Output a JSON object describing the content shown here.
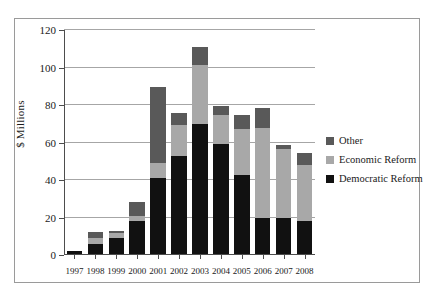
{
  "chart_data": {
    "type": "bar",
    "subtype": "stacked-vertical",
    "title": "",
    "xlabel": "",
    "ylabel": "$ Millions",
    "ylim": [
      0,
      120
    ],
    "yticks": [
      0,
      20,
      40,
      60,
      80,
      100,
      120
    ],
    "ytick_labels": [
      "0",
      "20",
      "40",
      "60",
      "80",
      "100",
      "120"
    ],
    "grid": true,
    "grid_axis": "y",
    "legend_position": "right",
    "categories": [
      "1997",
      "1998",
      "1999",
      "2000",
      "2001",
      "2002",
      "2003",
      "2004",
      "2005",
      "2006",
      "2007",
      "2008"
    ],
    "series": [
      {
        "name": "Democratic Reform",
        "color": "#111111",
        "values": [
          1.5,
          5.5,
          8.5,
          17.5,
          40.5,
          52.5,
          69.5,
          58.5,
          42,
          19,
          19,
          17.5
        ]
      },
      {
        "name": "Economic Reform",
        "color": "#a8a8a8",
        "values": [
          0,
          3,
          2.5,
          3,
          8,
          16.5,
          31.5,
          15.5,
          24.5,
          48,
          37,
          30
        ]
      },
      {
        "name": "Other",
        "color": "#595959",
        "values": [
          0,
          3,
          1.5,
          7,
          40.5,
          6,
          9.5,
          5,
          7.5,
          11,
          2,
          6.5
        ]
      }
    ],
    "totals": [
      1.5,
      11.5,
      12.5,
      27.5,
      89,
      75,
      110.5,
      79,
      74,
      78,
      58,
      54
    ]
  },
  "legend": {
    "items": [
      {
        "label": "Other",
        "color": "#595959"
      },
      {
        "label": "Economic Reform",
        "color": "#a8a8a8"
      },
      {
        "label": "Democratic Reform",
        "color": "#111111"
      }
    ]
  },
  "colors": {
    "frame": "#9a9a9a",
    "axis": "#4d4d4d",
    "grid": "#a6a6a6",
    "background": "#ffffff",
    "text": "#1a1a1a"
  }
}
